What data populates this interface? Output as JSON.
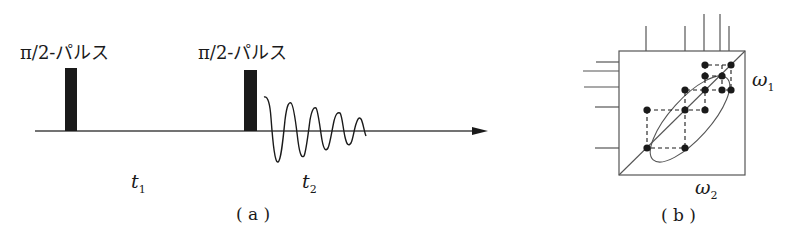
{
  "panel_a": {
    "caption": "( a )",
    "pulse_labels": [
      "π/2-パルス",
      "π/2-パルス"
    ],
    "interval_labels": {
      "t1": {
        "base": "t",
        "sub": "1"
      },
      "t2": {
        "base": "t",
        "sub": "2"
      }
    },
    "elements": [
      "baseline-arrow",
      "pulse-1",
      "pulse-2",
      "fid-decay-signal"
    ]
  },
  "panel_b": {
    "caption": "( b )",
    "axis_labels": {
      "omega1": {
        "base": "ω",
        "sub": "1"
      },
      "omega2": {
        "base": "ω",
        "sub": "2"
      }
    },
    "elements": [
      "2d-spectrum-box",
      "diagonal-line",
      "cross-peak-dots",
      "dashed-connectors",
      "ellipse-highlight",
      "top-projection-lines",
      "left-projection-lines"
    ]
  },
  "colors": {
    "ink": "#1a1a1a",
    "line": "#555555",
    "background": "#ffffff"
  }
}
